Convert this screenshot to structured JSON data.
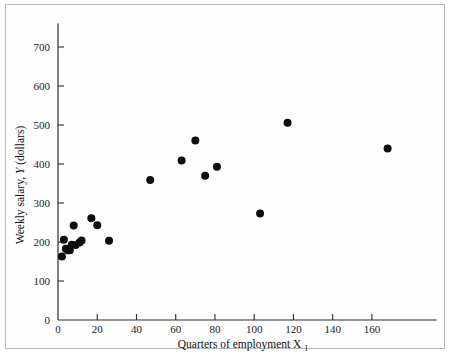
{
  "figure": {
    "background_color": "#ffffff",
    "frame_color": "#b9b9b9",
    "axis_color": "#2a2a2a",
    "point_color": "#0d0d0d"
  },
  "chart_data": {
    "type": "scatter",
    "title": "",
    "xlabel": "Quarters of employment X",
    "xlabel_subscript": "1",
    "ylabel": "Weekly salary, Y (dollars)",
    "ylabel_parts": {
      "prefix": "Weekly salary, ",
      "variable": "Y",
      "suffix": " (dollars)"
    },
    "xlim": [
      0,
      193
    ],
    "ylim": [
      0,
      760
    ],
    "xticks": [
      0,
      20,
      40,
      60,
      80,
      100,
      120,
      140,
      160
    ],
    "yticks": [
      0,
      100,
      200,
      300,
      400,
      500,
      600,
      700
    ],
    "xtick_labels": [
      "0",
      "20",
      "40",
      "60",
      "80",
      "100",
      "120",
      "140",
      "160"
    ],
    "ytick_labels": [
      "0",
      "100",
      "200",
      "300",
      "400",
      "500",
      "600",
      "700"
    ],
    "grid": false,
    "legend": null,
    "marker": "filled-circle",
    "marker_size": 4,
    "points": [
      {
        "x": 2,
        "y": 163
      },
      {
        "x": 3,
        "y": 206
      },
      {
        "x": 4,
        "y": 183
      },
      {
        "x": 5,
        "y": 179
      },
      {
        "x": 6,
        "y": 179
      },
      {
        "x": 7,
        "y": 193
      },
      {
        "x": 8,
        "y": 242
      },
      {
        "x": 9,
        "y": 192
      },
      {
        "x": 11,
        "y": 199
      },
      {
        "x": 12,
        "y": 204
      },
      {
        "x": 17,
        "y": 261
      },
      {
        "x": 20,
        "y": 243
      },
      {
        "x": 26,
        "y": 203
      },
      {
        "x": 47,
        "y": 359
      },
      {
        "x": 63,
        "y": 409
      },
      {
        "x": 70,
        "y": 460
      },
      {
        "x": 75,
        "y": 370
      },
      {
        "x": 81,
        "y": 393
      },
      {
        "x": 103,
        "y": 273
      },
      {
        "x": 117,
        "y": 506
      },
      {
        "x": 168,
        "y": 440
      }
    ]
  }
}
